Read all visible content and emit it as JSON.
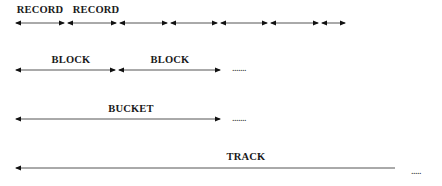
{
  "rows": {
    "record": {
      "labels": [
        "RECORD",
        "RECORD"
      ]
    },
    "block": {
      "labels": [
        "BLOCK",
        "BLOCK"
      ],
      "continuation": "......."
    },
    "bucket": {
      "label": "BUCKET",
      "continuation": "......."
    },
    "track": {
      "label": "TRACK",
      "continuation": "....."
    }
  },
  "colors": {
    "line": "#555555",
    "arrowhead": "#111111",
    "text": "#1a1a1a"
  }
}
